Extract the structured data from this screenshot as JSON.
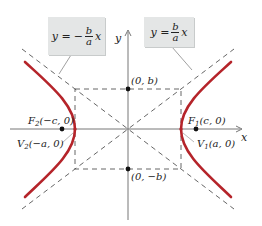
{
  "diagram": {
    "type": "hyperbola",
    "colors": {
      "curve": "#b5242a",
      "axes": "#666666",
      "dashed": "#555555",
      "box_bg": "#e4e6e6"
    },
    "axes": {
      "x_label": "x",
      "y_label": "y"
    },
    "asymptotes": {
      "negative": {
        "lhs": "y =",
        "sign": "−",
        "num": "b",
        "den": "a",
        "var": "x"
      },
      "positive": {
        "lhs": "y =",
        "sign": "",
        "num": "b",
        "den": "a",
        "var": "x"
      }
    },
    "points": {
      "F2": {
        "name": "F",
        "sub": "2",
        "coords": "(−c, 0)"
      },
      "F1": {
        "name": "F",
        "sub": "1",
        "coords": "(c, 0)"
      },
      "V2": {
        "name": "V",
        "sub": "2",
        "coords": "(−a, 0)"
      },
      "V1": {
        "name": "V",
        "sub": "1",
        "coords": "(a, 0)"
      },
      "top": {
        "coords": "(0, b)"
      },
      "bottom": {
        "coords": "(0, −b)"
      }
    }
  }
}
